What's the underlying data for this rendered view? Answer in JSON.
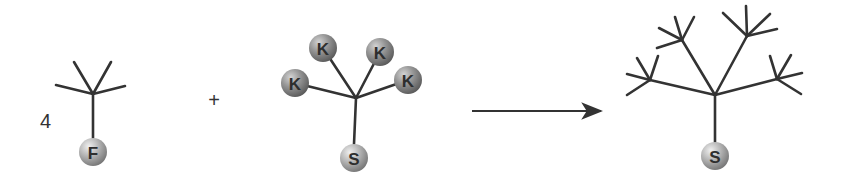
{
  "diagram": {
    "type": "reaction-scheme",
    "reactant1": {
      "coefficient": "4",
      "center": [
        93,
        94
      ],
      "branch_ends": [
        [
          56,
          85
        ],
        [
          74,
          62
        ],
        [
          111,
          62
        ],
        [
          125,
          86
        ]
      ],
      "focal_group": {
        "label": "F",
        "position": [
          93,
          152
        ],
        "radius": 14
      }
    },
    "operator": {
      "symbol": "+",
      "position": [
        214,
        100
      ]
    },
    "reactant2": {
      "center": [
        356,
        98
      ],
      "coupling_groups": [
        {
          "label": "K",
          "position": [
            295,
            83
          ]
        },
        {
          "label": "K",
          "position": [
            323,
            48
          ]
        },
        {
          "label": "K",
          "position": [
            380,
            52
          ]
        },
        {
          "label": "K",
          "position": [
            408,
            80
          ]
        }
      ],
      "focal_group": {
        "label": "S",
        "position": [
          354,
          158
        ],
        "radius": 14
      }
    },
    "arrow": {
      "from": [
        472,
        111
      ],
      "to": [
        605,
        111
      ]
    },
    "product": {
      "center": [
        715,
        95
      ],
      "branches": [
        {
          "node": [
            650,
            80
          ],
          "ends": [
            [
              627,
              74
            ],
            [
              627,
              95
            ],
            [
              637,
              58
            ],
            [
              658,
              56
            ]
          ]
        },
        {
          "node": [
            682,
            40
          ],
          "ends": [
            [
              657,
              48
            ],
            [
              659,
              28
            ],
            [
              675,
              17
            ],
            [
              694,
              17
            ]
          ]
        },
        {
          "node": [
            747,
            36
          ],
          "ends": [
            [
              723,
              13
            ],
            [
              746,
              6
            ],
            [
              770,
              14
            ],
            [
              777,
              29
            ]
          ]
        },
        {
          "node": [
            777,
            79
          ],
          "ends": [
            [
              770,
              56
            ],
            [
              791,
              55
            ],
            [
              802,
              73
            ],
            [
              801,
              94
            ]
          ]
        }
      ],
      "focal_group": {
        "label": "S",
        "position": [
          715,
          156
        ],
        "radius": 14
      }
    },
    "colors": {
      "bond": "#333333",
      "ball_light": "#e2e2e2",
      "ball_mid": "#b0b0b0",
      "ball_dark": "#7a7a7a",
      "k_ball_light": "#c8c8c8",
      "k_ball_mid": "#8f8f8f",
      "k_ball_dark": "#5e5e5e",
      "label": "#2e2e2e"
    }
  }
}
